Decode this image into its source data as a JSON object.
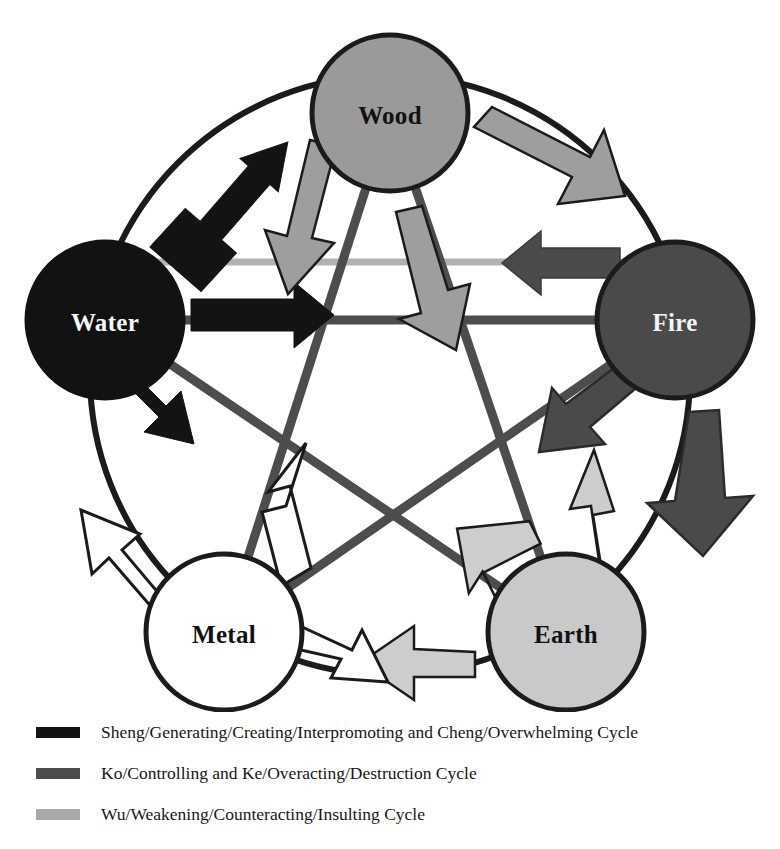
{
  "diagram": {
    "type": "cycle-diagram",
    "canvas": {
      "width": 780,
      "height": 712
    },
    "outer_circle": {
      "cx": 390,
      "cy": 375,
      "r": 300,
      "stroke": "#1b1b1b",
      "stroke_width": 6,
      "fill": "none"
    },
    "colors": {
      "sheng": "#131313",
      "ko": "#4d4d4d",
      "wu": "#a9a9a9",
      "wu_light": "#cfcfcf",
      "outline": "#1b1b1b",
      "white": "#ffffff",
      "background": "#ffffff"
    },
    "nodes": [
      {
        "id": "wood",
        "label": "Wood",
        "cx": 390,
        "cy": 113,
        "r": 78,
        "fill": "#9a9a9a",
        "text_fill": "#111111",
        "stroke": "#1b1b1b"
      },
      {
        "id": "fire",
        "label": "Fire",
        "cx": 675,
        "cy": 320,
        "r": 78,
        "fill": "#4a4a4a",
        "text_fill": "#f4f4f4",
        "stroke": "#1b1b1b"
      },
      {
        "id": "earth",
        "label": "Earth",
        "cx": 566,
        "cy": 632,
        "r": 78,
        "fill": "#c9c9c9",
        "text_fill": "#111111",
        "stroke": "#1b1b1b"
      },
      {
        "id": "metal",
        "label": "Metal",
        "cx": 224,
        "cy": 632,
        "r": 78,
        "fill": "#ffffff",
        "text_fill": "#111111",
        "stroke": "#1b1b1b"
      },
      {
        "id": "water",
        "label": "Water",
        "cx": 105,
        "cy": 320,
        "r": 78,
        "fill": "#121212",
        "text_fill": "#f7f7f7",
        "stroke": "#121212"
      }
    ],
    "cycles": [
      {
        "id": "sheng",
        "name": "Sheng/Generating/Creating/Interpromoting and Cheng/Overwhelming Cycle",
        "color": "#131313",
        "path": "outer-clockwise + inner-star",
        "edges": [
          {
            "from": "water",
            "to": "wood",
            "kind": "outer",
            "arrow": true
          },
          {
            "from": "water",
            "to": "metal",
            "kind": "outer",
            "arrow": true
          },
          {
            "from": "water",
            "to": "fire",
            "kind": "inner",
            "arrow": true
          }
        ]
      },
      {
        "id": "ko",
        "name": "Ko/Controlling and Ke/Overacting/Destruction Cycle",
        "color": "#4d4d4d",
        "edges": [
          {
            "from": "fire",
            "to": "earth",
            "kind": "outer",
            "arrow": true
          },
          {
            "from": "fire",
            "to": "metal",
            "kind": "inner",
            "arrow": true
          },
          {
            "from": "fire",
            "to": "metal",
            "kind": "inner-horizontal",
            "arrow": true
          },
          {
            "from": "earth",
            "to": "water",
            "kind": "inner",
            "arrow": false
          }
        ]
      },
      {
        "id": "wu",
        "name": "Wu/Weakening/Counteracting/Insulting Cycle",
        "color": "#a9a9a9",
        "edges": [
          {
            "from": "wood",
            "to": "fire",
            "kind": "outer",
            "arrow": true
          },
          {
            "from": "wood",
            "to": "earth",
            "kind": "inner",
            "arrow": true
          },
          {
            "from": "wood",
            "to": "metal",
            "kind": "inner",
            "arrow": true
          },
          {
            "from": "earth",
            "to": "metal",
            "kind": "outer",
            "arrow": true
          },
          {
            "from": "earth",
            "to": "wood",
            "kind": "inner",
            "arrow": true
          },
          {
            "from": "earth",
            "to": "water",
            "kind": "inner",
            "arrow": true
          },
          {
            "from": "metal",
            "to": "water",
            "kind": "outer",
            "arrow": true
          },
          {
            "from": "metal",
            "to": "wood",
            "kind": "inner",
            "arrow": true
          },
          {
            "from": "metal",
            "to": "earth",
            "kind": "inner",
            "arrow": true
          }
        ]
      }
    ]
  },
  "legend": {
    "items": [
      {
        "id": "sheng",
        "swatch_color": "#131313",
        "label": "Sheng/Generating/Creating/Interpromoting and Cheng/Overwhelming Cycle"
      },
      {
        "id": "ko",
        "swatch_color": "#4d4d4d",
        "label": "Ko/Controlling and Ke/Overacting/Destruction Cycle"
      },
      {
        "id": "wu",
        "swatch_color": "#a9a9a9",
        "label": "Wu/Weakening/Counteracting/Insulting Cycle"
      }
    ]
  }
}
